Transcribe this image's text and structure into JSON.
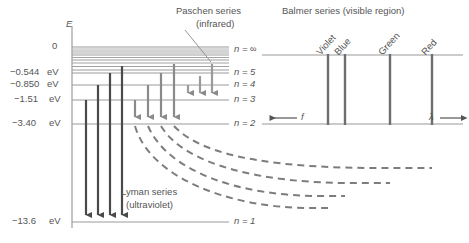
{
  "left_panel": {
    "axis_label": "E",
    "energy_labels": [
      {
        "text": "0",
        "y": 47,
        "unit": ""
      },
      {
        "text": "−0.544",
        "y": 73,
        "unit": "eV"
      },
      {
        "text": "−0.850",
        "y": 85,
        "unit": "eV"
      },
      {
        "text": "−1.51",
        "y": 100,
        "unit": "eV"
      },
      {
        "text": "−3.40",
        "y": 124,
        "unit": "eV"
      },
      {
        "text": "−13.6",
        "y": 222,
        "unit": "eV"
      }
    ],
    "level_labels": [
      {
        "text": "n = ∞",
        "y": 50
      },
      {
        "text": "n = 5",
        "y": 73
      },
      {
        "text": "n = 4",
        "y": 85
      },
      {
        "text": "n = 3",
        "y": 100
      },
      {
        "text": "n = 2",
        "y": 124
      },
      {
        "text": "n = 1",
        "y": 222
      }
    ],
    "series_annotations": [
      {
        "name": "paschen",
        "line1": "Paschen series",
        "line2": "(infrared)",
        "x": 176,
        "y": 8
      },
      {
        "name": "lyman",
        "line1": "Lyman series",
        "line2": "(ultraviolet)",
        "x": 121,
        "y": 186
      }
    ]
  },
  "right_panel": {
    "title": "Balmer series (visible region)",
    "spectral_lines": [
      {
        "label": "Violet",
        "x": 328
      },
      {
        "label": "Blue",
        "x": 345
      },
      {
        "label": "Green",
        "x": 390
      },
      {
        "label": "Red",
        "x": 432
      }
    ],
    "axis_arrows": [
      {
        "symbol": "f",
        "direction": "left"
      },
      {
        "symbol": "λ",
        "direction": "right"
      }
    ]
  },
  "colors": {
    "dark_arrow": "#4a4a4a",
    "gray_arrow": "#8a8a8a",
    "level_line": "#9a9a9a",
    "dashed_curve": "#7d7d7d",
    "spectral_line": "#6e6e6e",
    "text": "#555555"
  }
}
